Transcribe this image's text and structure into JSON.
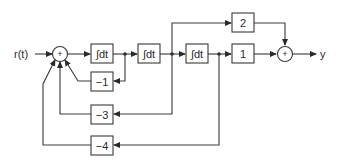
{
  "diagram": {
    "type": "block-diagram",
    "input_label": "r(t)",
    "output_label": "y",
    "summing_junctions": [
      {
        "id": "sum1",
        "sign": "+"
      },
      {
        "id": "sum2",
        "sign": "+"
      }
    ],
    "forward_blocks": [
      {
        "id": "int1",
        "label": "∫dt"
      },
      {
        "id": "int2",
        "label": "∫dt"
      },
      {
        "id": "int3",
        "label": "∫dt"
      }
    ],
    "output_gains": [
      {
        "id": "gain2",
        "label": "2"
      },
      {
        "id": "gain1",
        "label": "1"
      }
    ],
    "feedback_gains": [
      {
        "id": "fb1",
        "label": "−1"
      },
      {
        "id": "fb3",
        "label": "−3"
      },
      {
        "id": "fb4",
        "label": "−4"
      }
    ],
    "connections": [
      "r(t) → sum1",
      "sum1 → int1",
      "int1 → int2 (tap → −1 → sum1)",
      "int2 → int3 (tap → 2 → sum2; tap → −3 → sum1)",
      "int3 → 1 → sum2 (tap → −4 → sum1)",
      "sum2 → y"
    ]
  }
}
